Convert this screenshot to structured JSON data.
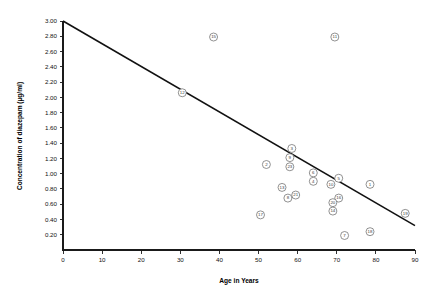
{
  "chart_data": {
    "type": "scatter",
    "title": "",
    "xlabel": "Age in Years",
    "ylabel": "Concentration of diazepam (µg/ml)",
    "xlim": [
      0,
      90
    ],
    "ylim": [
      0,
      3.0
    ],
    "grid": false,
    "legend": "none",
    "x_ticks": [
      0,
      10,
      20,
      30,
      40,
      50,
      60,
      70,
      80,
      90
    ],
    "x_tick_labels": [
      "0",
      "10",
      "20",
      "30",
      "40",
      "50",
      "60",
      "70",
      "80",
      "90"
    ],
    "y_ticks": [
      0.2,
      0.4,
      0.6,
      0.8,
      1.0,
      1.2,
      1.4,
      1.6,
      1.8,
      2.0,
      2.2,
      2.4,
      2.6,
      2.8,
      3.0
    ],
    "y_tick_labels": [
      "0.20",
      "0.40",
      "0.60",
      "0.80",
      "1.00",
      "1.20",
      "1.40",
      "1.60",
      "1.80",
      "2.00",
      "2.20",
      "2.40",
      "2.60",
      "2.80",
      "3.00"
    ],
    "series": [
      {
        "name": "subjects",
        "marker": "labelled-circle",
        "points": [
          {
            "label": "15",
            "x": 38.5,
            "y": 2.79
          },
          {
            "label": "11",
            "x": 69.5,
            "y": 2.79
          },
          {
            "label": "12",
            "x": 30.5,
            "y": 2.06
          },
          {
            "label": "3",
            "x": 58.5,
            "y": 1.33
          },
          {
            "label": "9",
            "x": 58.0,
            "y": 1.21
          },
          {
            "label": "2",
            "x": 52.0,
            "y": 1.12
          },
          {
            "label": "23",
            "x": 58.0,
            "y": 1.09
          },
          {
            "label": "6",
            "x": 64.0,
            "y": 1.01
          },
          {
            "label": "5",
            "x": 70.5,
            "y": 0.94
          },
          {
            "label": "4",
            "x": 64.0,
            "y": 0.9
          },
          {
            "label": "10",
            "x": 68.5,
            "y": 0.86
          },
          {
            "label": "1",
            "x": 78.5,
            "y": 0.86
          },
          {
            "label": "13",
            "x": 56.0,
            "y": 0.82
          },
          {
            "label": "21",
            "x": 59.5,
            "y": 0.72
          },
          {
            "label": "8",
            "x": 57.5,
            "y": 0.68
          },
          {
            "label": "16",
            "x": 70.5,
            "y": 0.68
          },
          {
            "label": "20",
            "x": 69.0,
            "y": 0.62
          },
          {
            "label": "14",
            "x": 69.0,
            "y": 0.51
          },
          {
            "label": "19",
            "x": 87.5,
            "y": 0.48
          },
          {
            "label": "17",
            "x": 50.5,
            "y": 0.46
          },
          {
            "label": "18",
            "x": 78.5,
            "y": 0.24
          },
          {
            "label": "7",
            "x": 72.0,
            "y": 0.19
          }
        ]
      }
    ],
    "trendline": {
      "name": "regression-line",
      "x_start": 0,
      "y_start": 3.0,
      "x_end": 90,
      "y_end": 0.32
    },
    "colors": {
      "axis": "#1a1a1a",
      "trendline": "#111111",
      "marker_stroke": "#6e6e6e",
      "marker_fill": "#ffffff",
      "text": "#111111"
    }
  }
}
